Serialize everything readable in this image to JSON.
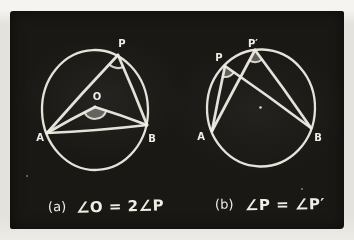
{
  "colors": {
    "page": "#e3e2dd",
    "page-top": "#f5f4f0",
    "board": "#191815",
    "chalk": "#f0ede5"
  },
  "diagrams": [
    {
      "labels": {
        "p": "P",
        "o": "O",
        "a": "A",
        "b": "B"
      },
      "caption": {
        "index": "(a)",
        "equation": "∠O = 2∠P"
      }
    },
    {
      "labels": {
        "p": "P",
        "p_prime": "P′",
        "a": "A",
        "b": "B"
      },
      "caption": {
        "index": "(b)",
        "equation": "∠P = ∠P′"
      }
    }
  ]
}
